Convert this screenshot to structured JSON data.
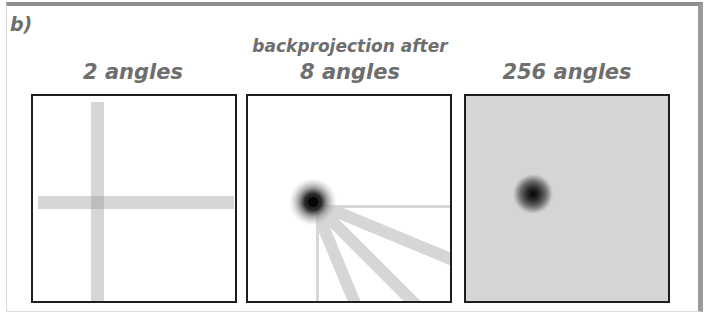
{
  "figure": {
    "label": "b)",
    "header": "backprojection after",
    "colors": {
      "text": "#6e6e6e",
      "panel_border": "#1e1e1e",
      "bar_gray": "#d4d4d4",
      "dense_background": "#d5d5d5",
      "point_source": "#111111"
    },
    "panels": [
      {
        "title": "2 angles",
        "angles": 2,
        "description": "two perpendicular backprojection bars crossing at point source"
      },
      {
        "title": "8 angles",
        "angles": 8,
        "description": "star pattern of 16 rays converging at point source"
      },
      {
        "title": "256 angles",
        "angles": 256,
        "description": "blurred dark point on uniform gray background"
      }
    ]
  }
}
